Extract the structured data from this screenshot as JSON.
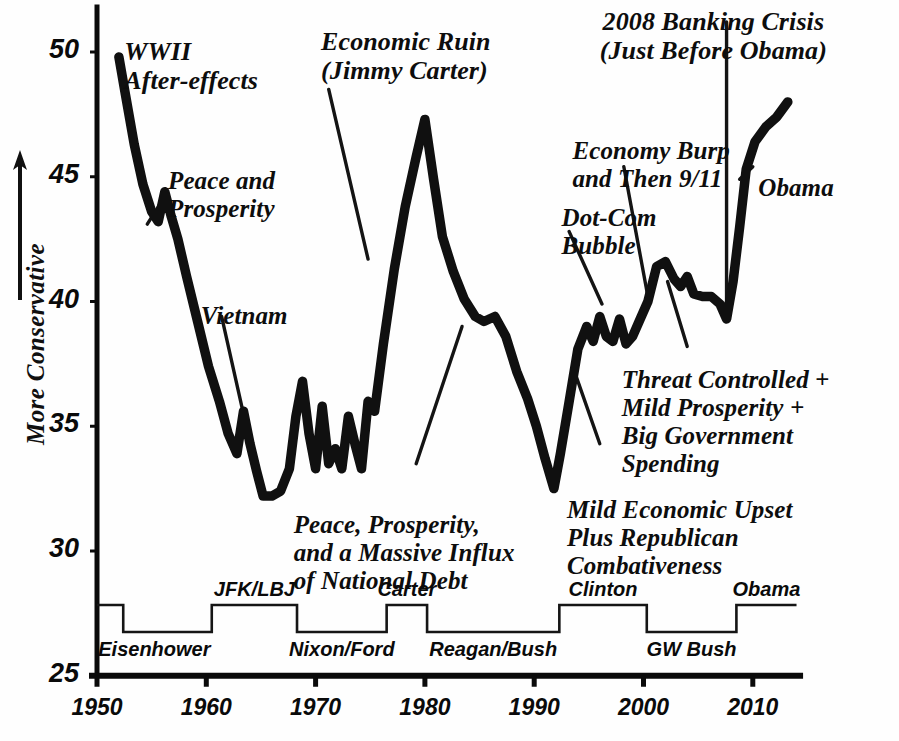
{
  "chart_data": {
    "type": "line",
    "title": "",
    "xlabel": "",
    "ylabel": "More Conservative",
    "xlim": [
      1950,
      2014
    ],
    "ylim": [
      25,
      52
    ],
    "grid": false,
    "legend": "none",
    "yticks": [
      "50",
      "45",
      "40",
      "35",
      "30",
      "25"
    ],
    "ytick_values": [
      50,
      45,
      40,
      35,
      30,
      25
    ],
    "xticks": [
      "1950",
      "1960",
      "1970",
      "1980",
      "1990",
      "2000",
      "2010"
    ],
    "xtick_values": [
      1950,
      1960,
      1970,
      1980,
      1990,
      2000,
      2010
    ],
    "series": [
      {
        "name": "Conservatism Index",
        "x": [
          1952.0,
          1952.6,
          1953.4,
          1954.2,
          1955.0,
          1955.6,
          1956.2,
          1956.8,
          1957.4,
          1958.2,
          1959.2,
          1960.2,
          1961.2,
          1962.0,
          1962.8,
          1963.4,
          1964.0,
          1964.6,
          1965.2,
          1966.0,
          1966.8,
          1967.6,
          1968.2,
          1968.8,
          1969.4,
          1970.0,
          1970.6,
          1971.2,
          1971.8,
          1972.4,
          1973.0,
          1973.6,
          1974.2,
          1974.8,
          1975.4,
          1976.2,
          1977.2,
          1978.2,
          1979.2,
          1980.0,
          1980.8,
          1981.6,
          1982.6,
          1983.6,
          1984.6,
          1985.4,
          1986.4,
          1987.4,
          1988.4,
          1989.4,
          1990.2,
          1991.0,
          1991.8,
          1992.4,
          1993.2,
          1994.0,
          1994.8,
          1995.4,
          1996.0,
          1996.6,
          1997.2,
          1997.8,
          1998.4,
          1999.0,
          1999.6,
          2000.4,
          2001.2,
          2002.0,
          2002.8,
          2003.4,
          2004.0,
          2004.6,
          2005.4,
          2006.2,
          2007.0,
          2007.6,
          2008.2,
          2008.8,
          2009.4,
          2010.2,
          2011.2,
          2012.2,
          2013.2
        ],
        "y": [
          49.8,
          48.3,
          46.3,
          44.7,
          43.6,
          43.2,
          44.4,
          43.4,
          42.5,
          41.0,
          39.2,
          37.4,
          36.0,
          34.7,
          33.9,
          35.6,
          34.3,
          33.2,
          32.2,
          32.2,
          32.4,
          33.3,
          35.4,
          36.8,
          34.7,
          33.3,
          35.8,
          33.5,
          34.1,
          33.3,
          35.4,
          34.3,
          33.3,
          36.0,
          35.6,
          38.3,
          41.3,
          43.8,
          45.8,
          47.3,
          44.9,
          42.6,
          41.2,
          40.1,
          39.4,
          39.2,
          39.4,
          38.6,
          37.2,
          36.1,
          35.0,
          33.7,
          32.5,
          33.9,
          36.0,
          38.1,
          39.0,
          38.4,
          39.4,
          38.6,
          38.4,
          39.3,
          38.3,
          38.6,
          39.2,
          40.0,
          41.4,
          41.6,
          40.9,
          40.6,
          41.0,
          40.3,
          40.2,
          40.2,
          39.9,
          39.3,
          40.8,
          43.0,
          45.3,
          46.4,
          47.0,
          47.4,
          48.0
        ]
      }
    ],
    "president_bar": {
      "high_label_side": "above",
      "terms": [
        {
          "label": "Eisenhower",
          "start": 1950.0,
          "end": 1952.4,
          "level": "high",
          "label_position": "below"
        },
        {
          "label": "Eisenhower",
          "start": 1952.4,
          "end": 1960.5,
          "level": "low",
          "label_position": "below"
        },
        {
          "label": "JFK/LBJ",
          "start": 1960.5,
          "end": 1968.3,
          "level": "high",
          "label_position": "above"
        },
        {
          "label": "Nixon/Ford",
          "start": 1968.3,
          "end": 1976.5,
          "level": "low",
          "label_position": "below"
        },
        {
          "label": "Carter",
          "start": 1976.5,
          "end": 1980.2,
          "level": "high",
          "label_position": "above"
        },
        {
          "label": "Reagan/Bush",
          "start": 1980.2,
          "end": 1992.3,
          "level": "low",
          "label_position": "below"
        },
        {
          "label": "Clinton",
          "start": 1992.3,
          "end": 2000.3,
          "level": "high",
          "label_position": "above"
        },
        {
          "label": "GW Bush",
          "start": 2000.3,
          "end": 2008.5,
          "level": "low",
          "label_position": "below"
        },
        {
          "label": "Obama",
          "start": 2008.5,
          "end": 2014.0,
          "level": "high",
          "label_position": "above"
        }
      ]
    },
    "annotations": [
      {
        "id": "wwii",
        "text": "WWII\nAfter-effects",
        "x": 1952.5,
        "y": 50.6
      },
      {
        "id": "peace",
        "text": "Peace and\nProsperity",
        "x": 1956.5,
        "y": 45.4
      },
      {
        "id": "vietnam",
        "text": "Vietnam",
        "x": 1959.5,
        "y": 40.0
      },
      {
        "id": "ruin",
        "text": "Economic Ruin\n(Jimmy Carter)",
        "x": 1970.5,
        "y": 51.0
      },
      {
        "id": "massive",
        "text": "Peace, Prosperity,\nand a Massive Influx\nof National Debt",
        "x": 1968.0,
        "y": 31.6
      },
      {
        "id": "dotcom",
        "text": "Dot-Com\nBubble",
        "x": 1992.5,
        "y": 43.9
      },
      {
        "id": "burp",
        "text": "Economy Burp\nand Then 9/11",
        "x": 1993.5,
        "y": 46.6
      },
      {
        "id": "banking",
        "text": "2008 Banking Crisis\n(Just Before Obama)",
        "x": 1996.0,
        "y": 51.8
      },
      {
        "id": "obama",
        "text": "Obama",
        "x": 2010.5,
        "y": 45.1
      },
      {
        "id": "threat",
        "text": "Threat Controlled +\nMild Prosperity  +\nBig Government\nSpending",
        "x": 1998.0,
        "y": 37.4
      },
      {
        "id": "mildupset",
        "text": "Mild Economic Upset\nPlus Republican\nCombativeness",
        "x": 1993.0,
        "y": 32.2
      }
    ],
    "leader_lines": [
      {
        "id": "peace-leader",
        "x1": 1956.2,
        "y1": 44.2,
        "x2": 1954.6,
        "y2": 43.1
      },
      {
        "id": "vietnam-leader",
        "x1": 1961.4,
        "y1": 39.4,
        "x2": 1963.4,
        "y2": 35.5
      },
      {
        "id": "ruin-leader",
        "x1": 1971.2,
        "y1": 48.5,
        "x2": 1974.8,
        "y2": 41.7
      },
      {
        "id": "massive-leader",
        "x1": 1983.4,
        "y1": 39.0,
        "x2": 1979.2,
        "y2": 33.5
      },
      {
        "id": "dotcom-leader",
        "x1": 1993.2,
        "y1": 42.8,
        "x2": 1996.2,
        "y2": 39.9
      },
      {
        "id": "burp-leader",
        "x1": 1998.2,
        "y1": 45.4,
        "x2": 2000.4,
        "y2": 40.2
      },
      {
        "id": "banking-leader",
        "x1": 2007.6,
        "y1": 51.2,
        "x2": 2007.6,
        "y2": 39.5
      },
      {
        "id": "obama-leader",
        "x1": 2010.0,
        "y1": 45.4,
        "x2": 2008.8,
        "y2": 44.9
      },
      {
        "id": "threat-leader",
        "x1": 2004.0,
        "y1": 38.2,
        "x2": 2002.2,
        "y2": 40.8
      },
      {
        "id": "mild-leader",
        "x1": 1996.0,
        "y1": 34.3,
        "x2": 1993.6,
        "y2": 37.3
      }
    ]
  },
  "axis": {
    "y_axis_title": "More Conservative",
    "y_arrow": "up-arrow"
  },
  "colors": {
    "line": "#101010",
    "axis": "#0a0a0a",
    "background": "#fefefe",
    "text": "#0d0d0d"
  }
}
